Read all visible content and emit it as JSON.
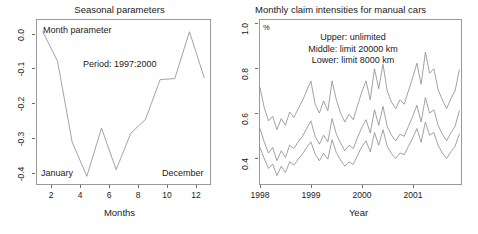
{
  "figure": {
    "background": "#ffffff",
    "line_color": "#8a8a8a",
    "frame_color": "#9a9a9a",
    "text_color": "#1a1a1a"
  },
  "left_panel": {
    "title": "Seasonal parameters",
    "xlabel": "Months",
    "annotations": {
      "month_parameter": "Month parameter",
      "period": "Period: 1997:2000",
      "first_month": "January",
      "last_month": "December"
    },
    "xticks": [
      "2",
      "4",
      "6",
      "8",
      "10",
      "12"
    ],
    "yticks": [
      "0.0",
      "-0.1",
      "-0.2",
      "-0.3",
      "-0.4"
    ]
  },
  "right_panel": {
    "title": "Monthly claim intensities for manual cars",
    "xlabel": "Year",
    "unit": "%",
    "legend": [
      "Upper: unlimited",
      "Middle: limit 20000 km",
      "Lower: limit 8000 km"
    ],
    "xticks": [
      "1998",
      "1999",
      "2000",
      "2001"
    ],
    "yticks": [
      "1.0",
      "0.8",
      "0.6",
      "0.4"
    ]
  },
  "chart_data": [
    {
      "type": "line",
      "title": "Seasonal parameters",
      "xlabel": "Months",
      "ylabel": "",
      "ylabel_text": "Month parameter",
      "annotation": "Period: 1997:2000",
      "xlim": [
        0.6,
        12.4
      ],
      "ylim": [
        -0.455,
        0.035
      ],
      "grid": false,
      "legend": null,
      "x": [
        1,
        2,
        3,
        4,
        5,
        6,
        7,
        8,
        9,
        10,
        11,
        12
      ],
      "categories": [
        "1",
        "2",
        "3",
        "4",
        "5",
        "6",
        "7",
        "8",
        "9",
        "10",
        "11",
        "12"
      ],
      "values": [
        0.0,
        -0.088,
        -0.33,
        -0.432,
        -0.288,
        -0.412,
        -0.303,
        -0.262,
        -0.143,
        -0.14,
        0.0,
        -0.137
      ]
    },
    {
      "type": "line",
      "title": "Monthly claim intensities for manual cars",
      "xlabel": "Year",
      "ylabel": "%",
      "xlim": [
        1998.0,
        2001.95
      ],
      "ylim": [
        0.28,
        1.02
      ],
      "grid": false,
      "legend_position": "inside-top",
      "x": [
        1998.0,
        1998.083,
        1998.167,
        1998.25,
        1998.333,
        1998.417,
        1998.5,
        1998.583,
        1998.667,
        1998.75,
        1998.833,
        1998.917,
        1999.0,
        1999.083,
        1999.167,
        1999.25,
        1999.333,
        1999.417,
        1999.5,
        1999.583,
        1999.667,
        1999.75,
        1999.833,
        1999.917,
        2000.0,
        2000.083,
        2000.167,
        2000.25,
        2000.333,
        2000.417,
        2000.5,
        2000.583,
        2000.667,
        2000.75,
        2000.833,
        2000.917,
        2001.0,
        2001.083,
        2001.167,
        2001.25,
        2001.333,
        2001.417,
        2001.5,
        2001.583,
        2001.667,
        2001.75,
        2001.833,
        2001.917
      ],
      "series": [
        {
          "name": "Upper: unlimited",
          "values": [
            0.715,
            0.625,
            0.565,
            0.585,
            0.525,
            0.575,
            0.545,
            0.605,
            0.58,
            0.62,
            0.655,
            0.7,
            0.745,
            0.64,
            0.6,
            0.655,
            0.61,
            0.745,
            0.66,
            0.6,
            0.56,
            0.595,
            0.57,
            0.635,
            0.695,
            0.745,
            0.66,
            0.8,
            0.71,
            0.82,
            0.7,
            0.65,
            0.62,
            0.66,
            0.64,
            0.7,
            0.76,
            0.825,
            0.73,
            0.875,
            0.78,
            0.8,
            0.705,
            0.66,
            0.62,
            0.665,
            0.7,
            0.795
          ]
        },
        {
          "name": "Middle: limit 20000 km",
          "values": [
            0.53,
            0.47,
            0.42,
            0.445,
            0.385,
            0.43,
            0.4,
            0.455,
            0.44,
            0.47,
            0.495,
            0.53,
            0.565,
            0.495,
            0.46,
            0.5,
            0.47,
            0.575,
            0.505,
            0.465,
            0.43,
            0.455,
            0.44,
            0.49,
            0.535,
            0.57,
            0.51,
            0.615,
            0.545,
            0.63,
            0.54,
            0.5,
            0.475,
            0.505,
            0.495,
            0.54,
            0.585,
            0.635,
            0.56,
            0.67,
            0.6,
            0.615,
            0.545,
            0.505,
            0.475,
            0.51,
            0.54,
            0.61
          ]
        },
        {
          "name": "Lower: limit 8000 km",
          "values": [
            0.445,
            0.395,
            0.35,
            0.37,
            0.318,
            0.36,
            0.332,
            0.38,
            0.365,
            0.392,
            0.415,
            0.445,
            0.47,
            0.415,
            0.385,
            0.418,
            0.392,
            0.48,
            0.422,
            0.388,
            0.36,
            0.38,
            0.368,
            0.41,
            0.448,
            0.475,
            0.425,
            0.512,
            0.455,
            0.525,
            0.45,
            0.418,
            0.395,
            0.42,
            0.412,
            0.45,
            0.488,
            0.53,
            0.468,
            0.56,
            0.5,
            0.512,
            0.455,
            0.42,
            0.395,
            0.425,
            0.45,
            0.505
          ]
        }
      ]
    }
  ]
}
